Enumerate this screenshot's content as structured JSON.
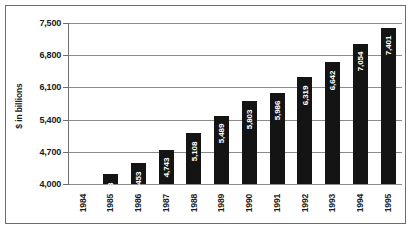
{
  "chart_data": {
    "type": "bar",
    "title": "",
    "subtitle": "",
    "xlabel": "",
    "ylabel": "$ in billions",
    "categories": [
      "1984",
      "1985",
      "1986",
      "1987",
      "1988",
      "1989",
      "1990",
      "1991",
      "1992",
      "1993",
      "1994",
      "1995"
    ],
    "values": [
      3933,
      4213,
      4453,
      4743,
      5108,
      5489,
      5803,
      5986,
      6319,
      6642,
      7054,
      7401
    ],
    "value_labels": [
      "3,933",
      "4,213",
      "4,453",
      "4,743",
      "5,108",
      "5,489",
      "5,803",
      "5,986",
      "6,319",
      "6,642",
      "7,054",
      "7,401"
    ],
    "ylim": [
      4000,
      7500
    ],
    "yticks": [
      4000,
      4700,
      5400,
      6100,
      6800,
      7500
    ],
    "ytick_labels": [
      "4,000",
      "4,700",
      "5,400",
      "6,100",
      "6,800",
      "7,500"
    ],
    "grid": true,
    "legend": "none",
    "bar_color": "#141414",
    "value_label_color": "#ffffff",
    "gridline_color": "#8a8a8a",
    "axis_color": "#6f6f6f",
    "border_color": "#6b6b6b",
    "background_color": "#ffffff"
  }
}
